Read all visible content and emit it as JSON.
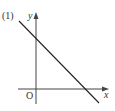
{
  "diagram": {
    "label": "(1)",
    "axes": {
      "x_label": "x",
      "y_label": "y",
      "origin_label": "O"
    },
    "line": {
      "description": "straight line with negative slope, positive y-intercept and positive x-intercept",
      "color": "#222222"
    },
    "colors": {
      "axis": "#444444",
      "text": "#333333",
      "background": "#ffffff"
    }
  }
}
